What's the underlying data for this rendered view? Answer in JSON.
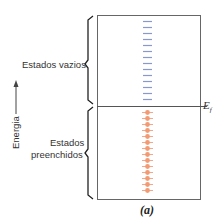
{
  "diagram": {
    "labels": {
      "empty_states": "Estados vazios",
      "filled_states_line1": "Estados",
      "filled_states_line2": "preenchidos",
      "energy_axis": "Energia",
      "fermi_level_symbol": "E",
      "fermi_level_subscript": "f",
      "caption": "(a)"
    },
    "colors": {
      "box": "#555555",
      "empty_state_dash": "#7a8fc9",
      "filled_state_dot": "#f08a5d",
      "text": "#333333"
    },
    "empty_state_count": 14,
    "filled_state_count": 14
  }
}
